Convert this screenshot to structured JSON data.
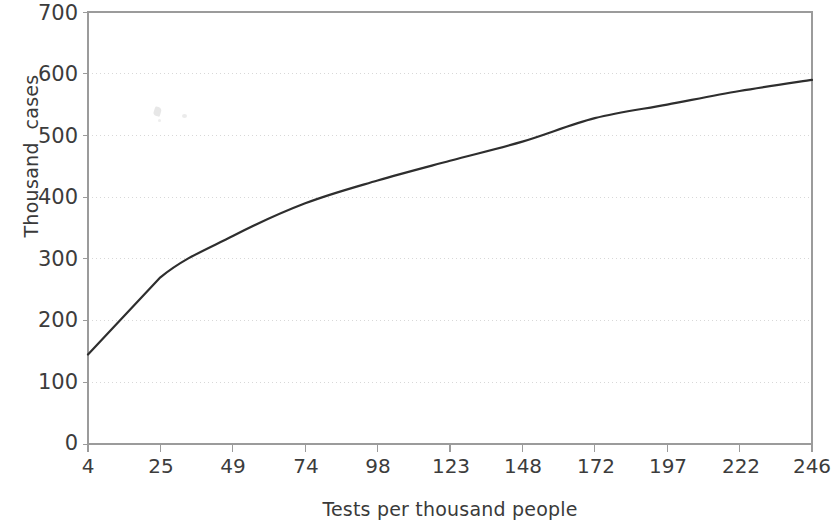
{
  "chart_data": {
    "type": "line",
    "title": "",
    "subtitle": "",
    "xlabel": "Tests per thousand people",
    "ylabel": "Thousand  cases",
    "categories": [
      "4",
      "25",
      "49",
      "74",
      "98",
      "123",
      "148",
      "172",
      "197",
      "222",
      "246"
    ],
    "values": [
      145,
      270,
      337,
      390,
      427,
      459,
      490,
      528,
      550,
      572,
      590
    ],
    "series": [
      {
        "name": "Thousand cases",
        "values": [
          145,
          270,
          337,
          390,
          427,
          459,
          490,
          528,
          550,
          572,
          590
        ]
      }
    ],
    "ylim": [
      0,
      700
    ],
    "y_ticks": [
      0,
      100,
      200,
      300,
      400,
      500,
      600,
      700
    ],
    "y_tick_labels": [
      "0",
      "100",
      "200",
      "300",
      "400",
      "500",
      "600",
      "700"
    ],
    "x_tick_labels": [
      "4",
      "25",
      "49",
      "74",
      "98",
      "123",
      "148",
      "172",
      "197",
      "222",
      "246"
    ],
    "grid": "horizontal-dotted",
    "legend": "none",
    "line_color": "#2e2e2e",
    "axis_color": "#9b9b9b",
    "grid_color": "#d8d8d8",
    "text_color": "#3c3c3c",
    "background_color": "#ffffff"
  }
}
